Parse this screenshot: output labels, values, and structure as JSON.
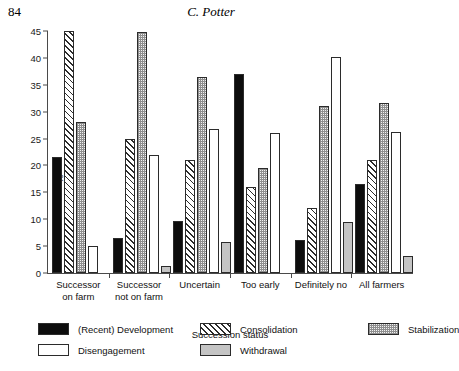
{
  "page": {
    "folio": "84",
    "running_head": "C. Potter"
  },
  "chart_data": {
    "type": "bar",
    "title": "",
    "xlabel": "Succession status",
    "ylabel": "%",
    "ylim": [
      0,
      45
    ],
    "yticks": [
      0,
      5,
      10,
      15,
      20,
      25,
      30,
      35,
      40,
      45
    ],
    "grid": false,
    "legend_position": "bottom",
    "categories": [
      "Successor\non farm",
      "Successor\nnot on farm",
      "Uncertain",
      "Too early",
      "Definitely no",
      "All farmers"
    ],
    "category_lines": [
      [
        "Successor",
        "on farm"
      ],
      [
        "Successor",
        "not on farm"
      ],
      [
        "Uncertain"
      ],
      [
        "Too early"
      ],
      [
        "Definitely no"
      ],
      [
        "All farmers"
      ]
    ],
    "series": [
      {
        "name": "(Recent) Development",
        "pattern": "solid-black",
        "color": "#0d0d0d",
        "values": [
          21.6,
          6.5,
          9.7,
          37.0,
          6.2,
          16.5
        ]
      },
      {
        "name": "Consolidation",
        "pattern": "diagonal-hatch",
        "color": "#ffffff",
        "values": [
          45.0,
          25.0,
          21.0,
          16.0,
          12.0,
          21.0
        ]
      },
      {
        "name": "Stabilization",
        "pattern": "stipple",
        "color": "#f2f2f2",
        "values": [
          28.0,
          44.8,
          36.5,
          19.5,
          31.0,
          31.7
        ]
      },
      {
        "name": "Disengagement",
        "pattern": "white-fill",
        "color": "#ffffff",
        "values": [
          5.0,
          22.0,
          26.7,
          26.0,
          40.2,
          26.3
        ]
      },
      {
        "name": "Withdrawal",
        "pattern": "grey-fill",
        "color": "#c4c4c4",
        "values": [
          0.0,
          1.3,
          5.7,
          0.0,
          9.5,
          3.2
        ]
      }
    ]
  },
  "legend": {
    "items": [
      {
        "label": "(Recent) Development",
        "pattern": "solid-black"
      },
      {
        "label": "Consolidation",
        "pattern": "diagonal-hatch"
      },
      {
        "label": "Stabilization",
        "pattern": "stipple"
      },
      {
        "label": "Disengagement",
        "pattern": "white-fill"
      },
      {
        "label": "Withdrawal",
        "pattern": "grey-fill"
      }
    ]
  }
}
